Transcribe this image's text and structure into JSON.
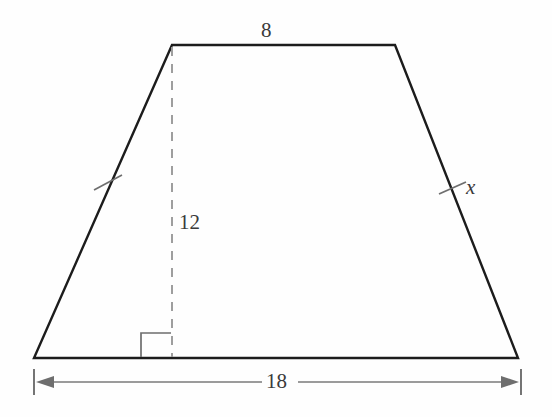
{
  "figure": {
    "kind": "isosceles-trapezoid-with-altitude",
    "background_color": "#fefefe",
    "outline_color": "#1c1c1c",
    "dashed_color": "#9a9a9a",
    "dimension_color": "#6e6e6e",
    "tick_color": "#6e6e6e",
    "label_color": "#3a3a3a"
  },
  "labels": {
    "top_base": "8",
    "height": "12",
    "leg_x": "x",
    "bottom_base": "18"
  },
  "geometry": {
    "top_left": [
      172,
      45
    ],
    "top_right": [
      395,
      45
    ],
    "bottom_right": [
      518,
      358
    ],
    "bottom_left": [
      34,
      358
    ],
    "altitude_foot": [
      172,
      358
    ],
    "right_angle_size": 24
  },
  "dimension_line": {
    "y": 382,
    "x_start": 34,
    "x_end": 520,
    "tick_top": 369,
    "tick_bottom": 395,
    "label": "18"
  },
  "congruence_ticks": [
    {
      "name": "left-leg-tick",
      "x": 108,
      "y": 182
    },
    {
      "name": "right-leg-tick",
      "x": 452,
      "y": 188
    }
  ]
}
